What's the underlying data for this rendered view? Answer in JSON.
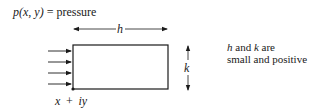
{
  "diagram": {
    "pressure_label": {
      "func": "p(x, y)",
      "eq": " = ",
      "word": "pressure"
    },
    "width_label": "h",
    "height_label": "k",
    "corner_label": "x + iy",
    "note": {
      "line1_h": "h",
      "line1_mid": " and ",
      "line1_k": "k",
      "line1_end": " are",
      "line2": "small and positive"
    },
    "arrow_count": 4,
    "colors": {
      "ink": "#1a1a1a",
      "background": "#ffffff"
    }
  }
}
